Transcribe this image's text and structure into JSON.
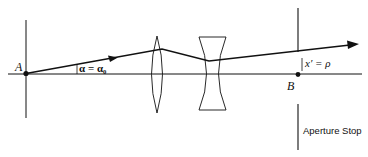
{
  "diagram": {
    "type": "optical ray diagram",
    "points": {
      "A": {
        "label": "A"
      },
      "B": {
        "label": "B"
      }
    },
    "angle_label": "α = α₀",
    "height_label": "x′ = ρ",
    "aperture_stop_label": "Aperture Stop",
    "elements": [
      "object plane at A",
      "biconvex lens",
      "biconcave lens",
      "aperture stop at B"
    ],
    "colors": {
      "line": "#111111",
      "background": "#ffffff"
    }
  }
}
